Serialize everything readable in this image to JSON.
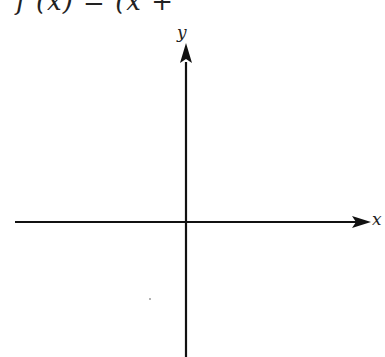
{
  "figure": {
    "title_partial": "f (x) = (x + ",
    "x_axis_label": "x",
    "y_axis_label": "y",
    "axis_color": "#111111",
    "background": "#ffffff"
  }
}
